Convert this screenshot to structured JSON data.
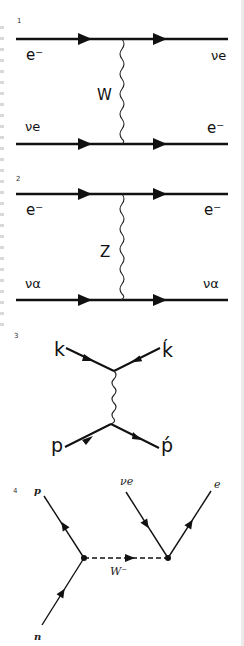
{
  "diagrams": [
    {
      "number": "1",
      "title": "charged-current scattering",
      "labels": {
        "in_top": "e⁻",
        "out_top": "νe",
        "boson": "W",
        "in_bottom": "νe",
        "out_bottom": "e⁻"
      }
    },
    {
      "number": "2",
      "title": "neutral-current scattering",
      "labels": {
        "in_top": "e⁻",
        "out_top": "e⁻",
        "boson": "Z",
        "in_bottom": "να",
        "out_bottom": "να"
      }
    },
    {
      "number": "3",
      "title": "t-channel exchange",
      "labels": {
        "in_top": "k",
        "out_top": "ḱ",
        "in_bottom": "p",
        "out_bottom": "ṕ"
      }
    },
    {
      "number": "4",
      "title": "beta decay",
      "labels": {
        "outgoing_proton": "p",
        "incoming_neutron": "n",
        "boson": "W⁻",
        "neutrino": "νe",
        "electron": "e"
      }
    }
  ],
  "colors": {
    "line": "#111111",
    "background": "#ffffff",
    "edge": "#ececec"
  }
}
